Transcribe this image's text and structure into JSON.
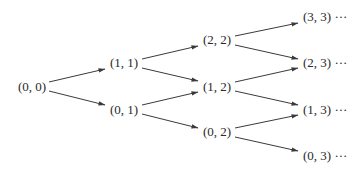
{
  "diagram": {
    "type": "lattice-tree",
    "nodes": [
      {
        "id": "n00",
        "label": "(0, 0)",
        "x": 18,
        "y": 87
      },
      {
        "id": "n11",
        "label": "(1, 1)",
        "x": 110,
        "y": 63
      },
      {
        "id": "n01",
        "label": "(0, 1)",
        "x": 110,
        "y": 110
      },
      {
        "id": "n22",
        "label": "(2, 2)",
        "x": 203,
        "y": 40
      },
      {
        "id": "n12",
        "label": "(1, 2)",
        "x": 203,
        "y": 87
      },
      {
        "id": "n02",
        "label": "(0, 2)",
        "x": 203,
        "y": 132
      },
      {
        "id": "n33",
        "label": "(3, 3) ···",
        "x": 303,
        "y": 17
      },
      {
        "id": "n23",
        "label": "(2, 3) ···",
        "x": 303,
        "y": 63
      },
      {
        "id": "n13",
        "label": "(1, 3) ···",
        "x": 303,
        "y": 110
      },
      {
        "id": "n03",
        "label": "(0, 3) ···",
        "x": 303,
        "y": 156
      }
    ],
    "edges": [
      {
        "from": "(0, 0)",
        "to": "(1, 1)",
        "x1": 49,
        "y1": 82,
        "x2": 105,
        "y2": 69
      },
      {
        "from": "(0, 0)",
        "to": "(0, 1)",
        "x1": 49,
        "y1": 91,
        "x2": 105,
        "y2": 105
      },
      {
        "from": "(1, 1)",
        "to": "(2, 2)",
        "x1": 142,
        "y1": 59,
        "x2": 198,
        "y2": 46
      },
      {
        "from": "(1, 1)",
        "to": "(1, 2)",
        "x1": 142,
        "y1": 68,
        "x2": 198,
        "y2": 81
      },
      {
        "from": "(0, 1)",
        "to": "(1, 2)",
        "x1": 142,
        "y1": 105,
        "x2": 198,
        "y2": 92
      },
      {
        "from": "(0, 1)",
        "to": "(0, 2)",
        "x1": 142,
        "y1": 114,
        "x2": 198,
        "y2": 128
      },
      {
        "from": "(2, 2)",
        "to": "(3, 3)",
        "x1": 235,
        "y1": 36,
        "x2": 298,
        "y2": 23
      },
      {
        "from": "(2, 2)",
        "to": "(2, 3)",
        "x1": 235,
        "y1": 45,
        "x2": 298,
        "y2": 59
      },
      {
        "from": "(1, 2)",
        "to": "(2, 3)",
        "x1": 235,
        "y1": 82,
        "x2": 298,
        "y2": 68
      },
      {
        "from": "(1, 2)",
        "to": "(1, 3)",
        "x1": 235,
        "y1": 91,
        "x2": 298,
        "y2": 105
      },
      {
        "from": "(0, 2)",
        "to": "(1, 3)",
        "x1": 235,
        "y1": 128,
        "x2": 298,
        "y2": 115
      },
      {
        "from": "(0, 2)",
        "to": "(0, 3)",
        "x1": 235,
        "y1": 137,
        "x2": 298,
        "y2": 151
      }
    ],
    "colors": {
      "line": "#3a3a3a",
      "text": "#2a2a2a",
      "background": "#ffffff"
    }
  }
}
